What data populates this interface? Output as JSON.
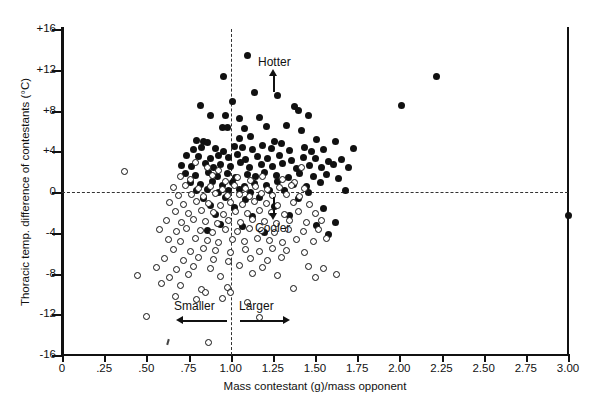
{
  "chart_data": {
    "type": "scatter",
    "title": "",
    "xlabel": "Mass contestant (g)/mass opponent",
    "ylabel": "Thoracic temp. difference of contestants (°C)",
    "xlim": [
      0,
      3.0
    ],
    "ylim": [
      -16,
      16
    ],
    "xticks": [
      0,
      0.25,
      0.5,
      0.75,
      1.0,
      1.25,
      1.5,
      1.75,
      2.0,
      2.25,
      2.5,
      2.75,
      3.0
    ],
    "xticklabels": [
      "0",
      ".25",
      ".50",
      ".75",
      "1.00",
      "1.25",
      "1.50",
      "1.75",
      "2.00",
      "2.25",
      "2.50",
      "2.75",
      "3.00"
    ],
    "yticks": [
      16,
      12,
      8,
      4,
      0,
      -4,
      -8,
      -12,
      -16
    ],
    "yticklabels": [
      "+16",
      "+12",
      "+8",
      "+4",
      "0",
      "-4",
      "-8",
      "-12",
      "-16"
    ],
    "grid": false,
    "legend_position": "none",
    "reference_lines": [
      {
        "orientation": "horizontal",
        "value": 0,
        "style": "dashed"
      },
      {
        "orientation": "vertical",
        "value": 1.0,
        "style": "dashed"
      }
    ],
    "annotations": [
      {
        "text": "Hotter",
        "x": 2.42,
        "y": 3.2,
        "arrow": "up"
      },
      {
        "text": "Cooler",
        "x": 2.42,
        "y": -3.3,
        "arrow": "down"
      },
      {
        "text": "Smaller",
        "x": 0.86,
        "y": -12.6,
        "arrow": "left"
      },
      {
        "text": "Larger",
        "x": 1.18,
        "y": -12.6,
        "arrow": "right"
      }
    ],
    "series": [
      {
        "name": "winner (filled circle)",
        "marker": "filled-circle",
        "color": "#111111",
        "points": [
          [
            1.1,
            13.4
          ],
          [
            0.96,
            11.3
          ],
          [
            2.22,
            11.3
          ],
          [
            1.14,
            9.8
          ],
          [
            1.28,
            9.5
          ],
          [
            0.82,
            8.5
          ],
          [
            1.01,
            8.9
          ],
          [
            1.38,
            8.4
          ],
          [
            1.4,
            8.0
          ],
          [
            2.01,
            8.5
          ],
          [
            0.88,
            7.5
          ],
          [
            0.97,
            7.5
          ],
          [
            1.05,
            7.2
          ],
          [
            1.17,
            7.3
          ],
          [
            1.46,
            7.5
          ],
          [
            0.95,
            6.3
          ],
          [
            0.98,
            6.3
          ],
          [
            1.08,
            6.2
          ],
          [
            1.21,
            6.4
          ],
          [
            1.33,
            6.5
          ],
          [
            1.42,
            6.0
          ],
          [
            0.8,
            5.1
          ],
          [
            0.84,
            5.0
          ],
          [
            0.86,
            4.9
          ],
          [
            1.05,
            5.3
          ],
          [
            1.12,
            5.4
          ],
          [
            1.26,
            5.0
          ],
          [
            1.3,
            4.8
          ],
          [
            1.51,
            5.2
          ],
          [
            1.62,
            5.0
          ],
          [
            0.78,
            4.2
          ],
          [
            0.83,
            4.4
          ],
          [
            0.91,
            4.3
          ],
          [
            0.96,
            4.0
          ],
          [
            1.02,
            4.5
          ],
          [
            1.07,
            4.4
          ],
          [
            1.13,
            4.2
          ],
          [
            1.19,
            4.6
          ],
          [
            1.24,
            4.3
          ],
          [
            1.35,
            4.1
          ],
          [
            1.44,
            4.4
          ],
          [
            1.48,
            4.0
          ],
          [
            1.55,
            4.2
          ],
          [
            1.73,
            4.3
          ],
          [
            0.74,
            3.6
          ],
          [
            0.81,
            3.5
          ],
          [
            0.88,
            3.3
          ],
          [
            0.93,
            3.6
          ],
          [
            0.99,
            3.4
          ],
          [
            1.04,
            3.7
          ],
          [
            1.09,
            3.2
          ],
          [
            1.16,
            3.5
          ],
          [
            1.22,
            3.3
          ],
          [
            1.29,
            3.6
          ],
          [
            1.36,
            3.1
          ],
          [
            1.43,
            3.4
          ],
          [
            1.5,
            3.3
          ],
          [
            1.58,
            3.0
          ],
          [
            1.66,
            3.2
          ],
          [
            0.71,
            2.6
          ],
          [
            0.77,
            2.5
          ],
          [
            0.85,
            2.8
          ],
          [
            0.9,
            2.4
          ],
          [
            0.94,
            2.7
          ],
          [
            1.0,
            2.5
          ],
          [
            1.06,
            2.9
          ],
          [
            1.11,
            2.4
          ],
          [
            1.18,
            2.7
          ],
          [
            1.25,
            2.5
          ],
          [
            1.31,
            2.8
          ],
          [
            1.39,
            2.3
          ],
          [
            1.47,
            2.6
          ],
          [
            1.54,
            2.4
          ],
          [
            1.61,
            2.7
          ],
          [
            1.7,
            2.4
          ],
          [
            0.73,
            1.8
          ],
          [
            0.79,
            1.6
          ],
          [
            0.87,
            1.9
          ],
          [
            0.92,
            1.5
          ],
          [
            0.98,
            1.8
          ],
          [
            1.03,
            1.4
          ],
          [
            1.1,
            1.7
          ],
          [
            1.15,
            1.5
          ],
          [
            1.2,
            1.9
          ],
          [
            1.27,
            1.6
          ],
          [
            1.34,
            1.4
          ],
          [
            1.41,
            1.8
          ],
          [
            1.49,
            1.5
          ],
          [
            1.57,
            1.7
          ],
          [
            1.64,
            1.3
          ],
          [
            0.76,
            0.9
          ],
          [
            0.82,
            0.7
          ],
          [
            0.89,
            1.0
          ],
          [
            0.95,
            0.6
          ],
          [
            1.01,
            0.9
          ],
          [
            1.08,
            0.5
          ],
          [
            1.14,
            0.8
          ],
          [
            1.21,
            0.6
          ],
          [
            1.28,
            1.0
          ],
          [
            1.37,
            0.7
          ],
          [
            1.45,
            0.5
          ],
          [
            1.53,
            0.9
          ],
          [
            0.8,
            0.1
          ],
          [
            0.86,
            0.2
          ],
          [
            0.93,
            0.0
          ],
          [
            0.99,
            0.1
          ],
          [
            1.05,
            0.2
          ],
          [
            1.12,
            0.0
          ],
          [
            1.23,
            0.1
          ],
          [
            1.32,
            0.1
          ],
          [
            1.46,
            0.0
          ],
          [
            1.68,
            0.1
          ],
          [
            0.84,
            -0.6
          ],
          [
            0.97,
            -0.5
          ],
          [
            1.09,
            -0.7
          ],
          [
            1.17,
            -0.5
          ],
          [
            1.4,
            -0.6
          ],
          [
            0.88,
            -1.3
          ],
          [
            1.02,
            -1.5
          ],
          [
            1.26,
            -1.4
          ],
          [
            1.55,
            -1.6
          ],
          [
            3.0,
            -2.3
          ],
          [
            0.91,
            -2.2
          ],
          [
            1.13,
            -2.4
          ],
          [
            1.35,
            -2.3
          ],
          [
            0.94,
            -3.2
          ],
          [
            1.07,
            -3.4
          ],
          [
            1.51,
            -3.3
          ],
          [
            1.62,
            -3.0
          ],
          [
            0.86,
            -3.8
          ],
          [
            1.2,
            -4.0
          ],
          [
            1.58,
            -4.2
          ]
        ]
      },
      {
        "name": "loser (open circle)",
        "marker": "open-circle",
        "color": "#111111",
        "points": [
          [
            0.37,
            2.0
          ],
          [
            0.79,
            2.9
          ],
          [
            0.86,
            2.4
          ],
          [
            0.93,
            2.1
          ],
          [
            1.42,
            2.4
          ],
          [
            0.7,
            1.5
          ],
          [
            0.76,
            1.2
          ],
          [
            0.89,
            1.6
          ],
          [
            0.97,
            1.0
          ],
          [
            1.04,
            1.4
          ],
          [
            1.12,
            1.1
          ],
          [
            1.19,
            1.5
          ],
          [
            1.31,
            1.2
          ],
          [
            1.38,
            0.9
          ],
          [
            0.66,
            0.4
          ],
          [
            0.73,
            0.6
          ],
          [
            0.81,
            0.3
          ],
          [
            0.88,
            0.5
          ],
          [
            0.95,
            0.2
          ],
          [
            1.02,
            0.6
          ],
          [
            1.09,
            0.3
          ],
          [
            1.15,
            0.5
          ],
          [
            1.22,
            0.2
          ],
          [
            1.29,
            0.4
          ],
          [
            1.36,
            0.6
          ],
          [
            1.44,
            0.3
          ],
          [
            0.69,
            -0.3
          ],
          [
            0.77,
            -0.2
          ],
          [
            0.84,
            -0.4
          ],
          [
            0.91,
            -0.1
          ],
          [
            0.98,
            -0.3
          ],
          [
            1.05,
            -0.2
          ],
          [
            1.11,
            -0.4
          ],
          [
            1.18,
            -0.1
          ],
          [
            1.25,
            -0.3
          ],
          [
            1.33,
            -0.2
          ],
          [
            1.41,
            -0.4
          ],
          [
            0.64,
            -1.0
          ],
          [
            0.72,
            -1.2
          ],
          [
            0.8,
            -0.9
          ],
          [
            0.87,
            -1.1
          ],
          [
            0.94,
            -1.3
          ],
          [
            1.0,
            -1.0
          ],
          [
            1.07,
            -1.2
          ],
          [
            1.14,
            -0.9
          ],
          [
            1.21,
            -1.1
          ],
          [
            1.28,
            -1.3
          ],
          [
            1.37,
            -1.0
          ],
          [
            1.47,
            -1.2
          ],
          [
            0.67,
            -1.9
          ],
          [
            0.75,
            -2.1
          ],
          [
            0.83,
            -1.8
          ],
          [
            0.9,
            -2.0
          ],
          [
            0.96,
            -2.2
          ],
          [
            1.03,
            -1.9
          ],
          [
            1.1,
            -2.1
          ],
          [
            1.17,
            -1.8
          ],
          [
            1.24,
            -2.0
          ],
          [
            1.32,
            -2.2
          ],
          [
            1.4,
            -1.9
          ],
          [
            1.5,
            -2.1
          ],
          [
            0.62,
            -2.8
          ],
          [
            0.71,
            -3.0
          ],
          [
            0.78,
            -2.7
          ],
          [
            0.85,
            -2.9
          ],
          [
            0.92,
            -3.1
          ],
          [
            0.99,
            -2.8
          ],
          [
            1.06,
            -3.0
          ],
          [
            1.13,
            -2.7
          ],
          [
            1.2,
            -2.9
          ],
          [
            1.27,
            -3.1
          ],
          [
            1.35,
            -2.8
          ],
          [
            1.45,
            -3.0
          ],
          [
            1.54,
            -2.8
          ],
          [
            0.58,
            -3.7
          ],
          [
            0.68,
            -3.9
          ],
          [
            0.74,
            -3.6
          ],
          [
            0.82,
            -3.8
          ],
          [
            0.89,
            -4.0
          ],
          [
            0.97,
            -3.7
          ],
          [
            1.04,
            -3.9
          ],
          [
            1.11,
            -3.6
          ],
          [
            1.18,
            -3.8
          ],
          [
            1.26,
            -4.0
          ],
          [
            1.34,
            -3.7
          ],
          [
            1.43,
            -3.9
          ],
          [
            1.52,
            -3.7
          ],
          [
            0.63,
            -4.7
          ],
          [
            0.7,
            -4.9
          ],
          [
            0.79,
            -4.6
          ],
          [
            0.86,
            -4.8
          ],
          [
            0.93,
            -5.0
          ],
          [
            1.01,
            -4.7
          ],
          [
            1.08,
            -4.9
          ],
          [
            1.16,
            -4.6
          ],
          [
            1.23,
            -4.8
          ],
          [
            1.31,
            -5.0
          ],
          [
            1.39,
            -4.7
          ],
          [
            1.49,
            -4.9
          ],
          [
            1.57,
            -4.6
          ],
          [
            0.66,
            -5.6
          ],
          [
            0.76,
            -5.8
          ],
          [
            0.84,
            -5.5
          ],
          [
            0.91,
            -5.7
          ],
          [
            1.0,
            -5.9
          ],
          [
            1.09,
            -5.6
          ],
          [
            1.17,
            -5.8
          ],
          [
            1.25,
            -5.5
          ],
          [
            1.33,
            -5.7
          ],
          [
            1.44,
            -5.9
          ],
          [
            0.61,
            -6.5
          ],
          [
            0.72,
            -6.7
          ],
          [
            0.81,
            -6.4
          ],
          [
            0.9,
            -6.6
          ],
          [
            0.99,
            -6.8
          ],
          [
            1.12,
            -6.5
          ],
          [
            1.22,
            -6.7
          ],
          [
            1.3,
            -6.4
          ],
          [
            0.56,
            -7.4
          ],
          [
            0.68,
            -7.6
          ],
          [
            0.78,
            -7.3
          ],
          [
            0.88,
            -7.5
          ],
          [
            1.05,
            -7.2
          ],
          [
            1.19,
            -7.4
          ],
          [
            1.46,
            -7.3
          ],
          [
            1.55,
            -7.5
          ],
          [
            0.45,
            -8.2
          ],
          [
            0.64,
            -8.4
          ],
          [
            0.75,
            -8.1
          ],
          [
            0.94,
            -8.3
          ],
          [
            1.13,
            -8.0
          ],
          [
            1.28,
            -8.2
          ],
          [
            1.5,
            -8.4
          ],
          [
            1.63,
            -8.1
          ],
          [
            0.59,
            -9.0
          ],
          [
            0.7,
            -9.2
          ],
          [
            0.83,
            -9.6
          ],
          [
            0.85,
            -9.9
          ],
          [
            0.98,
            -9.4
          ],
          [
            1.0,
            -9.9
          ],
          [
            1.37,
            -9.5
          ],
          [
            0.67,
            -10.3
          ],
          [
            0.8,
            -10.6
          ],
          [
            0.95,
            -10.5
          ],
          [
            1.1,
            -10.8
          ],
          [
            0.5,
            -12.2
          ],
          [
            1.17,
            -12.3
          ],
          [
            0.87,
            -14.8
          ]
        ]
      }
    ]
  }
}
